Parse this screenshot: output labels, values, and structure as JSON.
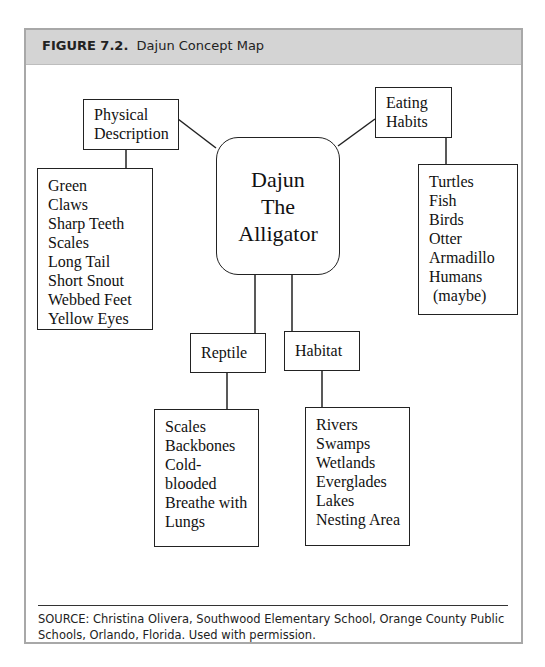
{
  "figure": {
    "label": "FIGURE 7.2.",
    "title": "Dajun Concept Map"
  },
  "concept_map": {
    "center": {
      "lines": [
        "Dajun",
        "The",
        "Alligator"
      ]
    },
    "branches": [
      {
        "id": "physical-description",
        "title_lines": [
          "Physical",
          "Description"
        ],
        "items": [
          "Green",
          "Claws",
          "Sharp Teeth",
          "Scales",
          "Long Tail",
          "Short Snout",
          "Webbed Feet",
          "Yellow Eyes"
        ]
      },
      {
        "id": "eating-habits",
        "title_lines": [
          "Eating",
          "Habits"
        ],
        "items": [
          "Turtles",
          "Fish",
          "Birds",
          "Otter",
          "Armadillo",
          "Humans",
          " (maybe)"
        ]
      },
      {
        "id": "reptile",
        "title_lines": [
          "Reptile"
        ],
        "items": [
          "Scales",
          "Backbones",
          "Cold-",
          "blooded",
          "Breathe with",
          "Lungs"
        ]
      },
      {
        "id": "habitat",
        "title_lines": [
          "Habitat"
        ],
        "items": [
          "Rivers",
          "Swamps",
          "Wetlands",
          "Everglades",
          "Lakes",
          "Nesting Area"
        ]
      }
    ]
  },
  "source": "SOURCE: Christina Olivera, Southwood Elementary School, Orange County Public Schools, Orlando, Florida. Used with permission.",
  "colors": {
    "header_bg": "#d4d4d4",
    "frame_border": "#a8a8a8",
    "line": "#222222"
  }
}
